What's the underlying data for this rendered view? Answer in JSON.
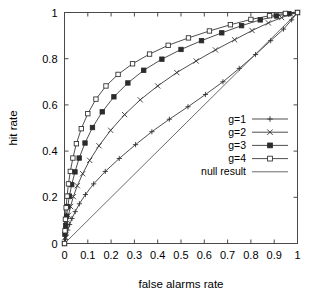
{
  "chart_data": {
    "type": "line",
    "title": "",
    "xlabel": "false alarms rate",
    "ylabel": "hit rate",
    "xlim": [
      0,
      1
    ],
    "ylim": [
      0,
      1
    ],
    "grid": false,
    "legend_position": "right-middle",
    "xticks": [
      "0",
      "0.1",
      "0.2",
      "0.3",
      "0.4",
      "0.5",
      "0.6",
      "0.7",
      "0.8",
      "0.9",
      "1"
    ],
    "xtick_values": [
      0,
      0.1,
      0.2,
      0.3,
      0.4,
      0.5,
      0.6,
      0.7,
      0.8,
      0.9,
      1
    ],
    "yticks": [
      "0",
      "0.2",
      "0.4",
      "0.6",
      "0.8",
      "1"
    ],
    "ytick_values": [
      0,
      0.2,
      0.4,
      0.6,
      0.8,
      1
    ],
    "series": [
      {
        "name": "g=1",
        "marker": "plus",
        "x": [
          0.0,
          0.004,
          0.008,
          0.014,
          0.022,
          0.032,
          0.046,
          0.064,
          0.09,
          0.125,
          0.175,
          0.235,
          0.305,
          0.375,
          0.45,
          0.53,
          0.605,
          0.68,
          0.75,
          0.82,
          0.885,
          0.94,
          0.975,
          1.0
        ],
        "y": [
          0.0,
          0.018,
          0.036,
          0.058,
          0.082,
          0.108,
          0.138,
          0.172,
          0.212,
          0.258,
          0.312,
          0.368,
          0.428,
          0.484,
          0.538,
          0.592,
          0.645,
          0.7,
          0.758,
          0.818,
          0.878,
          0.928,
          0.968,
          1.0
        ]
      },
      {
        "name": "g=2",
        "marker": "cross",
        "x": [
          0.0,
          0.003,
          0.006,
          0.011,
          0.017,
          0.026,
          0.038,
          0.055,
          0.078,
          0.108,
          0.148,
          0.198,
          0.258,
          0.325,
          0.4,
          0.482,
          0.565,
          0.648,
          0.73,
          0.805,
          0.875,
          0.932,
          0.972,
          1.0
        ],
        "y": [
          0.0,
          0.028,
          0.056,
          0.088,
          0.122,
          0.16,
          0.203,
          0.25,
          0.302,
          0.36,
          0.423,
          0.49,
          0.558,
          0.622,
          0.682,
          0.74,
          0.79,
          0.838,
          0.882,
          0.922,
          0.955,
          0.978,
          0.992,
          1.0
        ]
      },
      {
        "name": "g=3",
        "marker": "filled-square",
        "x": [
          0.0,
          0.002,
          0.005,
          0.009,
          0.014,
          0.021,
          0.031,
          0.045,
          0.063,
          0.088,
          0.12,
          0.162,
          0.212,
          0.272,
          0.34,
          0.418,
          0.5,
          0.588,
          0.675,
          0.76,
          0.84,
          0.91,
          0.963,
          1.0
        ],
        "y": [
          0.0,
          0.04,
          0.078,
          0.118,
          0.16,
          0.205,
          0.255,
          0.31,
          0.37,
          0.435,
          0.502,
          0.57,
          0.635,
          0.695,
          0.75,
          0.798,
          0.84,
          0.878,
          0.912,
          0.943,
          0.968,
          0.985,
          0.995,
          1.0
        ]
      },
      {
        "name": "g=4",
        "marker": "open-square",
        "x": [
          0.0,
          0.002,
          0.004,
          0.007,
          0.011,
          0.017,
          0.025,
          0.036,
          0.051,
          0.072,
          0.1,
          0.135,
          0.178,
          0.23,
          0.292,
          0.365,
          0.445,
          0.532,
          0.622,
          0.712,
          0.8,
          0.88,
          0.948,
          1.0
        ],
        "y": [
          0.0,
          0.055,
          0.105,
          0.155,
          0.205,
          0.258,
          0.312,
          0.37,
          0.432,
          0.497,
          0.562,
          0.625,
          0.682,
          0.732,
          0.778,
          0.82,
          0.858,
          0.89,
          0.92,
          0.947,
          0.97,
          0.986,
          0.996,
          1.0
        ]
      },
      {
        "name": "null result",
        "marker": "none",
        "x": [
          0.0,
          1.0
        ],
        "y": [
          0.0,
          1.0
        ]
      }
    ],
    "legend_entries": [
      {
        "label": "g=1",
        "marker": "plus"
      },
      {
        "label": "g=2",
        "marker": "cross"
      },
      {
        "label": "g=3",
        "marker": "filled-square"
      },
      {
        "label": "g=4",
        "marker": "open-square"
      },
      {
        "label": "null result",
        "marker": "none"
      }
    ]
  },
  "colors": {
    "background": "#ffffff",
    "axis": "#4a4a4a",
    "curve": "#3a3a3a",
    "marker": "#2b2b2b"
  }
}
